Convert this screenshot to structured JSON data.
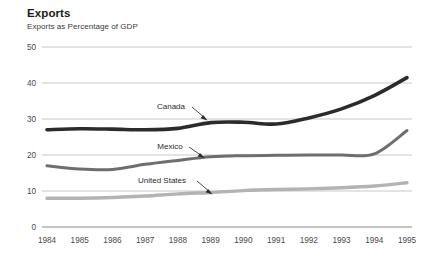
{
  "chart_data": {
    "type": "line",
    "title": "Exports",
    "subtitle": "Exports as Percentage of GDP",
    "xlabel": "",
    "ylabel": "",
    "ylim": [
      0,
      50
    ],
    "yticks": [
      0,
      10,
      20,
      30,
      40,
      50
    ],
    "grid": true,
    "legend_position": "inline-annotations",
    "categories": [
      "1984",
      "1985",
      "1986",
      "1987",
      "1988",
      "1989",
      "1990",
      "1991",
      "1992",
      "1993",
      "1994",
      "1995"
    ],
    "series": [
      {
        "name": "Canada",
        "color": "#2b2b2b",
        "values": [
          27.0,
          27.3,
          27.2,
          27.0,
          27.4,
          29.0,
          29.1,
          28.6,
          30.3,
          32.8,
          36.5,
          41.5
        ]
      },
      {
        "name": "Mexico",
        "color": "#6e6e6e",
        "values": [
          17.0,
          16.1,
          16.0,
          17.4,
          18.5,
          19.5,
          19.8,
          19.9,
          20.0,
          20.0,
          20.3,
          26.8
        ]
      },
      {
        "name": "United States",
        "color": "#b3b3b3",
        "values": [
          8.0,
          8.0,
          8.2,
          8.6,
          9.2,
          9.6,
          10.1,
          10.4,
          10.6,
          10.9,
          11.4,
          12.3
        ]
      }
    ],
    "annotations": [
      {
        "text": "Canada",
        "series": "Canada"
      },
      {
        "text": "Mexico",
        "series": "Mexico"
      },
      {
        "text": "United States",
        "series": "United States"
      }
    ]
  },
  "axis": {
    "y_tick_labels": [
      "50",
      "40",
      "30",
      "20",
      "10",
      "0"
    ],
    "x_tick_labels": [
      "1984",
      "1985",
      "1986",
      "1987",
      "1988",
      "1989",
      "1990",
      "1991",
      "1992",
      "1993",
      "1994",
      "1995"
    ]
  },
  "annotation_labels": {
    "canada": "Canada",
    "mexico": "Mexico",
    "united_states": "United States"
  }
}
